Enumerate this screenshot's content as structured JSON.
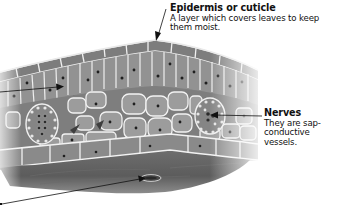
{
  "diagram": {
    "palette": {
      "background": "#ffffff",
      "tissue_dark": "#5a5a5a",
      "tissue_mid": "#8a8a8a",
      "tissue_light": "#a8a8a8",
      "cell_wall": "#f2f2f2",
      "nucleus": "#1e1e1e",
      "text": "#111111",
      "arrow": "#111111"
    },
    "labels": [
      {
        "id": "epidermis",
        "title": "Epidermis or cuticle",
        "description": "A layer which covers leaves to keep them moist."
      },
      {
        "id": "nerves",
        "title": "Nerves",
        "description": "They are sap-conductive vessels."
      }
    ],
    "pointers": [
      {
        "id": "epidermis-pointer",
        "target": "upper epidermis"
      },
      {
        "id": "nerves-pointer",
        "target": "vascular bundle (right)"
      },
      {
        "id": "left-pointer",
        "target": "palisade cell"
      },
      {
        "id": "bottom-left-pointer",
        "target": "stoma on lower epidermis"
      }
    ]
  }
}
